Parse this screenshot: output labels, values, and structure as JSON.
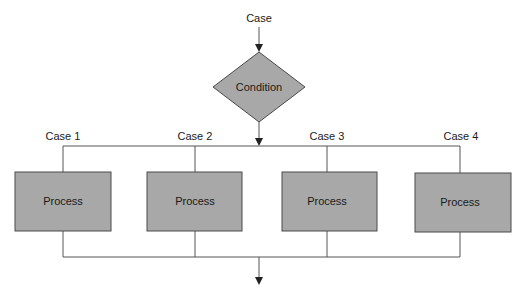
{
  "diagram": {
    "type": "flowchart-switch-case",
    "entry_label": "Case",
    "decision": {
      "label": "Condition",
      "shape": "diamond"
    },
    "branches": [
      {
        "case_label": "Case 1",
        "process_label": "Process"
      },
      {
        "case_label": "Case 2",
        "process_label": "Process"
      },
      {
        "case_label": "Case 3",
        "process_label": "Process"
      },
      {
        "case_label": "Case 4",
        "process_label": "Process"
      }
    ],
    "colors": {
      "shape_fill": "#a8a8a8",
      "shape_stroke": "#4a4a4a",
      "line": "#555555",
      "text": "#1a1a1a",
      "background": "#ffffff"
    }
  }
}
